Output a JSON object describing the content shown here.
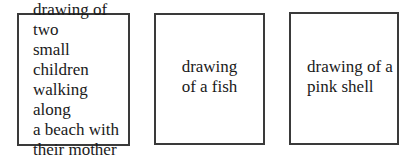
{
  "boxes": [
    {
      "label": "drawing of two\nsmall children\nwalking along\na beach with\ntheir mother"
    },
    {
      "label": "drawing\nof a fish"
    },
    {
      "label": "drawing of a\npink shell"
    }
  ],
  "colors": {
    "border": "#3a3a3a",
    "text": "#1a1a1a",
    "background": "#ffffff"
  }
}
